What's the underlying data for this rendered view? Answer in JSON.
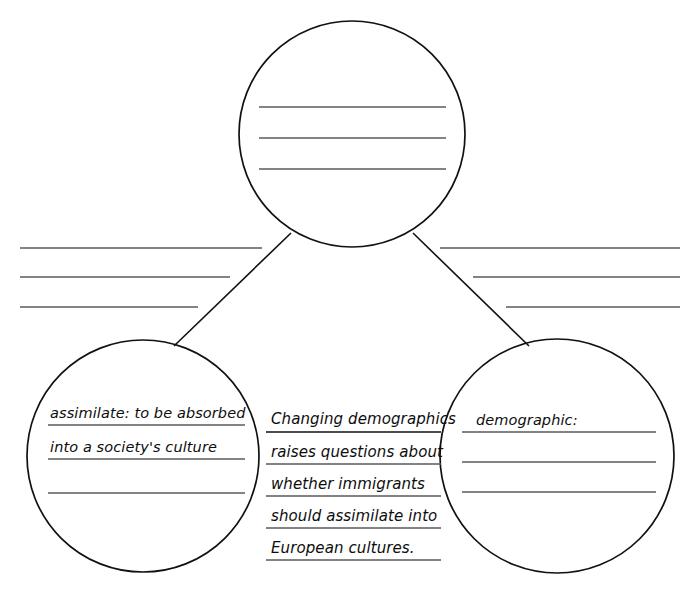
{
  "document": {
    "type": "concept-web-graphic-organizer",
    "ink_color": "#111111",
    "rule_color": "#5a5a5a",
    "background_color": "#ffffff"
  },
  "top_circle": {
    "name": "main-idea-circle",
    "text": "",
    "blank_lines": 3
  },
  "left_notes": {
    "name": "left-rule-lines",
    "lines": [
      "",
      "",
      ""
    ]
  },
  "right_notes": {
    "name": "right-rule-lines",
    "lines": [
      "",
      "",
      ""
    ]
  },
  "left_circle": {
    "name": "vocabulary-circle-assimilate",
    "lines": [
      "assimilate: to be absorbed",
      "into a society's culture",
      ""
    ]
  },
  "center_notes": {
    "name": "center-sentence-lines",
    "lines": [
      "Changing demographics",
      "raises questions about",
      "whether immigrants",
      "should assimilate into",
      "European cultures."
    ]
  },
  "right_circle": {
    "name": "vocabulary-circle-demographic",
    "lines": [
      "demographic:",
      "",
      ""
    ]
  }
}
